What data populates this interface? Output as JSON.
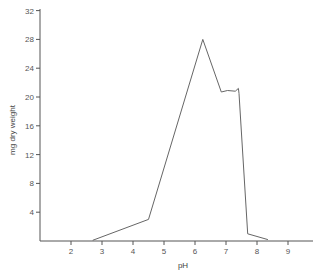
{
  "chart_data": {
    "type": "line",
    "title": "",
    "xlabel": "pH",
    "ylabel": "mg dry weight",
    "xlim": [
      1,
      10
    ],
    "ylim": [
      0,
      32
    ],
    "grid": false,
    "legend": null,
    "xticks": [
      2,
      3,
      4,
      5,
      6,
      7,
      8,
      9
    ],
    "yticks": [
      4,
      8,
      12,
      16,
      20,
      24,
      28,
      32
    ],
    "series": [
      {
        "name": "growth",
        "x": [
          2.7,
          4.5,
          6.25,
          6.85,
          7.05,
          7.3,
          7.4,
          7.42,
          7.7,
          8.35
        ],
        "y": [
          0.1,
          3.0,
          28.0,
          20.7,
          20.9,
          20.8,
          21.2,
          20.5,
          1.0,
          0.2
        ]
      }
    ]
  },
  "axes": {
    "x_title": "pH",
    "y_title": "mg dry weight"
  },
  "colors": {
    "axis": "#555555",
    "line": "#666666"
  }
}
